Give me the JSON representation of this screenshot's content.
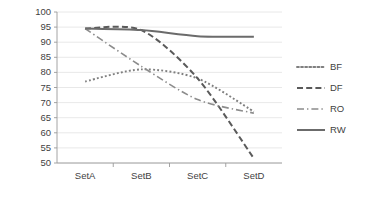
{
  "chart_data": {
    "type": "line",
    "title": "",
    "subtitle": "",
    "xlabel": "",
    "ylabel": "",
    "categories": [
      "SetA",
      "SetB",
      "SetC",
      "SetD"
    ],
    "ylim": [
      50,
      100
    ],
    "yticks": [
      50,
      55,
      60,
      65,
      70,
      75,
      80,
      85,
      90,
      95,
      100
    ],
    "grid": true,
    "legend_position": "right",
    "series": [
      {
        "name": "BF",
        "values": [
          77.0,
          81.0,
          78.0,
          67.0
        ],
        "style": "dotted",
        "color": "#7f7f7f"
      },
      {
        "name": "DF",
        "values": [
          94.5,
          94.0,
          78.0,
          51.5
        ],
        "style": "dashed",
        "color": "#5a5a5a"
      },
      {
        "name": "RO",
        "values": [
          94.5,
          82.0,
          71.0,
          66.5
        ],
        "style": "dashdot",
        "color": "#8c8c8c"
      },
      {
        "name": "RW",
        "values": [
          94.5,
          94.0,
          92.0,
          91.8
        ],
        "style": "solid",
        "color": "#6b6b6b"
      }
    ]
  },
  "axis": {
    "y_tick_labels": [
      "100",
      "95",
      "90",
      "85",
      "80",
      "75",
      "70",
      "65",
      "60",
      "55",
      "50"
    ],
    "x_tick_labels": [
      "SetA",
      "SetB",
      "SetC",
      "SetD"
    ]
  },
  "legend": {
    "entries": [
      {
        "label": "BF"
      },
      {
        "label": "DF"
      },
      {
        "label": "RO"
      },
      {
        "label": "RW"
      }
    ]
  },
  "colors": {
    "background": "#ffffff",
    "gridline": "#e2e2e2",
    "axis": "#9a9a9a",
    "text": "#3f3f3f"
  }
}
